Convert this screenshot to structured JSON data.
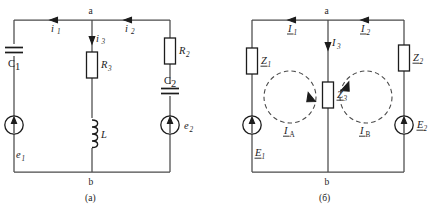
{
  "figure": {
    "background_color": "#ffffff",
    "wire_color": "#4a4a4a",
    "ink_color": "#1c1c1c"
  },
  "panel_a": {
    "caption": "(a)",
    "nodes": {
      "top": "a",
      "bottom": "b"
    },
    "currents": [
      {
        "name": "i1",
        "label": "i",
        "subscript": "1",
        "direction": "right",
        "branch": "left-top"
      },
      {
        "name": "i2",
        "label": "i",
        "subscript": "2",
        "direction": "right",
        "branch": "right-top"
      },
      {
        "name": "i3",
        "label": "i",
        "subscript": "3",
        "direction": "down",
        "branch": "middle"
      }
    ],
    "components": [
      {
        "name": "C1",
        "type": "capacitor",
        "label": "C",
        "subscript": "1",
        "branch": "left"
      },
      {
        "name": "e1",
        "type": "source",
        "label": "e",
        "subscript": "1",
        "branch": "left",
        "arrow": "up"
      },
      {
        "name": "R3",
        "type": "resistor",
        "label": "R",
        "subscript": "3",
        "branch": "middle"
      },
      {
        "name": "L",
        "type": "inductor",
        "label": "L",
        "subscript": "",
        "branch": "middle"
      },
      {
        "name": "R2",
        "type": "resistor",
        "label": "R",
        "subscript": "2",
        "branch": "right"
      },
      {
        "name": "C2",
        "type": "capacitor",
        "label": "C",
        "subscript": "2",
        "branch": "right"
      },
      {
        "name": "e2",
        "type": "source",
        "label": "e",
        "subscript": "2",
        "branch": "right",
        "arrow": "up"
      }
    ]
  },
  "panel_b": {
    "caption": "(б)",
    "nodes": {
      "top": "a",
      "bottom": "b"
    },
    "currents": [
      {
        "name": "I1",
        "label": "I",
        "subscript": "1",
        "direction": "right",
        "branch": "left-top",
        "underlined": true
      },
      {
        "name": "I2",
        "label": "I",
        "subscript": "2",
        "direction": "right",
        "branch": "right-top",
        "underlined": true
      },
      {
        "name": "I3",
        "label": "I",
        "subscript": "3",
        "direction": "down",
        "branch": "middle",
        "underlined": false
      }
    ],
    "mesh_currents": [
      {
        "name": "IA",
        "label": "I",
        "subscript": "A",
        "rotation": "clockwise",
        "underlined": true
      },
      {
        "name": "IB",
        "label": "I",
        "subscript": "B",
        "rotation": "counter-clockwise",
        "underlined": true
      }
    ],
    "components": [
      {
        "name": "Z1",
        "type": "impedance",
        "label": "Z",
        "subscript": "1",
        "branch": "left",
        "underlined": true
      },
      {
        "name": "E1",
        "type": "source",
        "label": "E",
        "subscript": "1",
        "branch": "left",
        "arrow": "up",
        "underlined": true
      },
      {
        "name": "Z3",
        "type": "impedance",
        "label": "Z",
        "subscript": "3",
        "branch": "middle",
        "underlined": true
      },
      {
        "name": "Z2",
        "type": "impedance",
        "label": "Z",
        "subscript": "2",
        "branch": "right",
        "underlined": true
      },
      {
        "name": "E2",
        "type": "source",
        "label": "E",
        "subscript": "2",
        "branch": "right",
        "arrow": "up",
        "underlined": true
      }
    ]
  }
}
